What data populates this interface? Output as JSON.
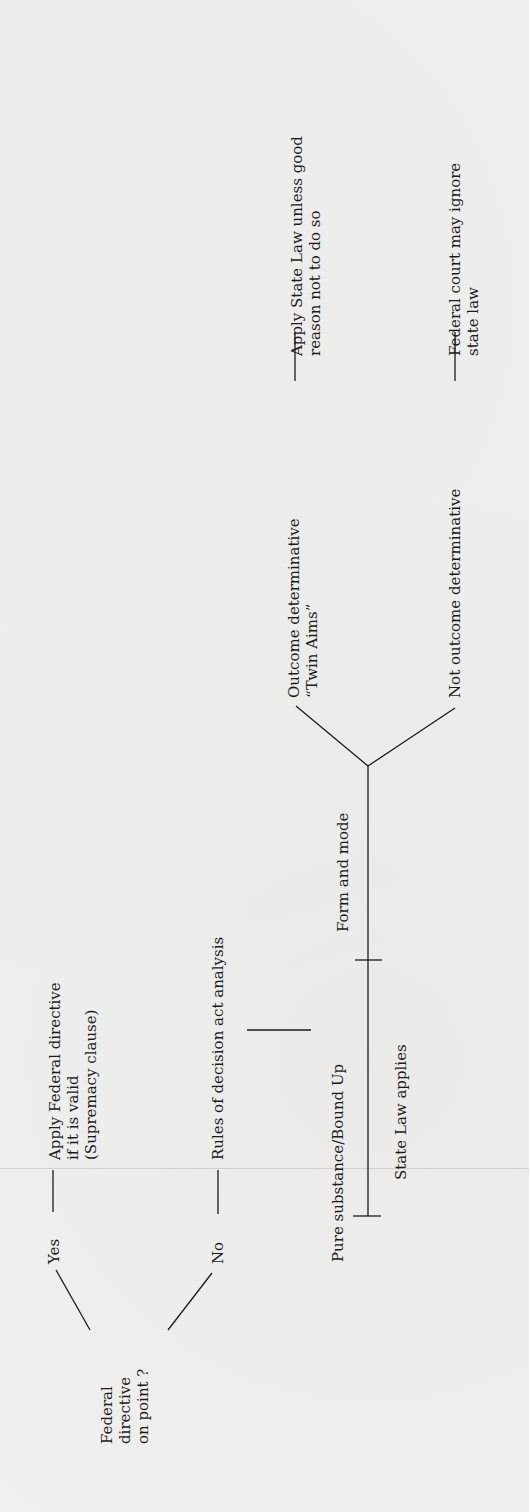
{
  "diagram": {
    "orientation": "rotated-90-ccw",
    "root": {
      "label_lines": [
        "Federal",
        "directive",
        "on point ?"
      ]
    },
    "branches": {
      "yes": {
        "label": "Yes",
        "outcome_lines": [
          "Apply Federal directive",
          "if it is valid",
          "(Supremacy clause)"
        ]
      },
      "no": {
        "label": "No",
        "outcome_lines": [
          "Rules of decision act analysis"
        ]
      }
    },
    "spectrum": {
      "left_end": "Pure substance/Bound Up",
      "left_result": "State Law applies",
      "right_end": "Form and mode"
    },
    "form_and_mode_branches": {
      "outcome_determinative": {
        "label_lines": [
          "Outcome determinative",
          "“Twin Aims”"
        ],
        "result_lines": [
          "Apply State Law unless good",
          "reason not to do so"
        ]
      },
      "not_outcome_determinative": {
        "label_lines": [
          "Not outcome determinative"
        ],
        "result_lines": [
          "Federal court may ignore",
          "state law"
        ]
      }
    },
    "colors": {
      "ink": "#1b1b1b",
      "paper": "#f0f0ee"
    }
  }
}
